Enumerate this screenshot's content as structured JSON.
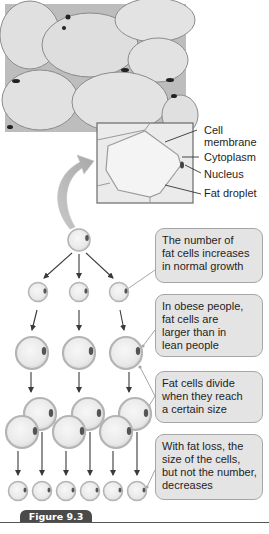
{
  "figure": {
    "label": "Figure 9.3",
    "tab_color": "#4a4a4a"
  },
  "micrograph": {
    "description": "Grayscale micrograph of adipose tissue showing large fat cells",
    "inset_labels": [
      {
        "text_line1": "Cell",
        "text_line2": "membrane"
      },
      {
        "text_line1": "Cytoplasm"
      },
      {
        "text_line1": "Nucleus"
      },
      {
        "text_line1": "Fat droplet"
      }
    ]
  },
  "callouts": [
    {
      "lines": [
        "The number of",
        "fat cells increases",
        "in normal growth"
      ]
    },
    {
      "lines": [
        "In obese people,",
        "fat cells are",
        "larger than in",
        "lean people"
      ]
    },
    {
      "lines": [
        "Fat cells divide",
        "when they reach",
        "a certain size"
      ]
    },
    {
      "lines": [
        "With fat loss, the",
        "size of the cells,",
        "but not the number,",
        "decreases"
      ]
    }
  ],
  "colors": {
    "callout_fill": "#e4e4e4",
    "callout_border": "#a6a6a6",
    "cell_fill": "#eeeeee",
    "cell_ring": "#b9b9b9",
    "nucleus": "#555555",
    "arrow": "#3a3a3a"
  }
}
